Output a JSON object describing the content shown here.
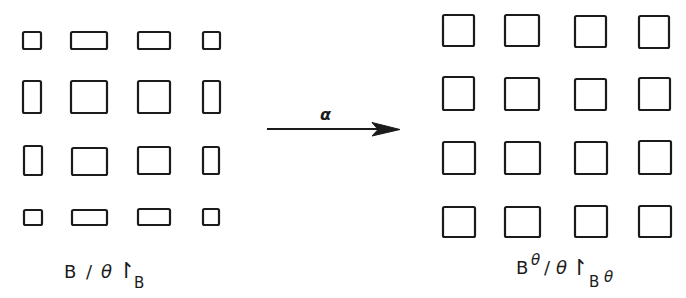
{
  "diagram": {
    "type": "lattice-transformation",
    "stroke_color": "#1b1b1b",
    "background": "#ffffff",
    "left_grid": {
      "rows": 4,
      "cols": 4,
      "description": "corner cells small, edge cells elongated, interior cells large",
      "boxes": [
        {
          "r": 0,
          "c": 0,
          "x": 23,
          "y": 32,
          "w": 18,
          "h": 17
        },
        {
          "r": 0,
          "c": 1,
          "x": 71,
          "y": 32,
          "w": 36,
          "h": 17
        },
        {
          "r": 0,
          "c": 2,
          "x": 138,
          "y": 32,
          "w": 32,
          "h": 17
        },
        {
          "r": 0,
          "c": 3,
          "x": 203,
          "y": 32,
          "w": 17,
          "h": 17
        },
        {
          "r": 1,
          "c": 0,
          "x": 23,
          "y": 81,
          "w": 18,
          "h": 32
        },
        {
          "r": 1,
          "c": 1,
          "x": 71,
          "y": 81,
          "w": 36,
          "h": 32
        },
        {
          "r": 1,
          "c": 2,
          "x": 138,
          "y": 81,
          "w": 32,
          "h": 32
        },
        {
          "r": 1,
          "c": 3,
          "x": 203,
          "y": 81,
          "w": 17,
          "h": 32
        },
        {
          "r": 2,
          "c": 0,
          "x": 24,
          "y": 146,
          "w": 18,
          "h": 29
        },
        {
          "r": 2,
          "c": 1,
          "x": 72,
          "y": 148,
          "w": 35,
          "h": 27
        },
        {
          "r": 2,
          "c": 2,
          "x": 138,
          "y": 147,
          "w": 32,
          "h": 27
        },
        {
          "r": 2,
          "c": 3,
          "x": 203,
          "y": 147,
          "w": 16,
          "h": 27
        },
        {
          "r": 3,
          "c": 0,
          "x": 24,
          "y": 210,
          "w": 18,
          "h": 15
        },
        {
          "r": 3,
          "c": 1,
          "x": 72,
          "y": 210,
          "w": 35,
          "h": 15
        },
        {
          "r": 3,
          "c": 2,
          "x": 138,
          "y": 209,
          "w": 32,
          "h": 16
        },
        {
          "r": 3,
          "c": 3,
          "x": 203,
          "y": 209,
          "w": 16,
          "h": 16
        }
      ],
      "label": {
        "base": "B",
        "slash": "/",
        "theta": "θ",
        "restrict": "↾",
        "subscript": "B"
      }
    },
    "arrow": {
      "label": "α",
      "x1": 267,
      "y1": 129,
      "x2": 400,
      "y2": 129
    },
    "right_grid": {
      "rows": 4,
      "cols": 4,
      "description": "all cells uniform squares",
      "boxes": [
        {
          "r": 0,
          "c": 0,
          "x": 443,
          "y": 15,
          "w": 31,
          "h": 31
        },
        {
          "r": 0,
          "c": 1,
          "x": 505,
          "y": 15,
          "w": 34,
          "h": 31
        },
        {
          "r": 0,
          "c": 2,
          "x": 575,
          "y": 16,
          "w": 31,
          "h": 31
        },
        {
          "r": 0,
          "c": 3,
          "x": 639,
          "y": 16,
          "w": 30,
          "h": 32
        },
        {
          "r": 1,
          "c": 0,
          "x": 443,
          "y": 77,
          "w": 31,
          "h": 33
        },
        {
          "r": 1,
          "c": 1,
          "x": 505,
          "y": 78,
          "w": 34,
          "h": 32
        },
        {
          "r": 1,
          "c": 2,
          "x": 575,
          "y": 79,
          "w": 31,
          "h": 31
        },
        {
          "r": 1,
          "c": 3,
          "x": 639,
          "y": 78,
          "w": 31,
          "h": 32
        },
        {
          "r": 2,
          "c": 0,
          "x": 443,
          "y": 142,
          "w": 32,
          "h": 32
        },
        {
          "r": 2,
          "c": 1,
          "x": 505,
          "y": 142,
          "w": 35,
          "h": 32
        },
        {
          "r": 2,
          "c": 2,
          "x": 575,
          "y": 142,
          "w": 32,
          "h": 32
        },
        {
          "r": 2,
          "c": 3,
          "x": 639,
          "y": 141,
          "w": 32,
          "h": 33
        },
        {
          "r": 3,
          "c": 0,
          "x": 443,
          "y": 207,
          "w": 32,
          "h": 30
        },
        {
          "r": 3,
          "c": 1,
          "x": 505,
          "y": 207,
          "w": 35,
          "h": 30
        },
        {
          "r": 3,
          "c": 2,
          "x": 575,
          "y": 206,
          "w": 32,
          "h": 31
        },
        {
          "r": 3,
          "c": 3,
          "x": 639,
          "y": 206,
          "w": 32,
          "h": 31
        }
      ],
      "label": {
        "base": "B",
        "superscript": "θ",
        "slash": "/",
        "theta": "θ",
        "restrict": "↾",
        "subscript": "B",
        "subscript_sup": "θ"
      }
    }
  }
}
